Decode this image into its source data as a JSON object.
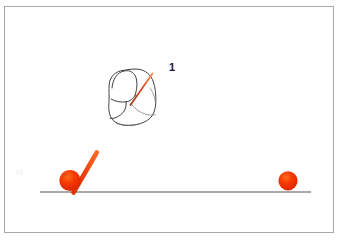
{
  "scene": {
    "title": "Hand-drawn physics sketch: fist with rod and two balls on a ground line",
    "background_color": "#ffffff",
    "border_color": "#a8a8a8",
    "border_width_px": 1,
    "frame": {
      "x": 4,
      "y": 6,
      "width": 330,
      "height": 227
    }
  },
  "labels": {
    "figure_number": "1"
  },
  "colors": {
    "ball_red": "#f03000",
    "ball_red_highlight": "#ff5a0f",
    "ball_red_shadow": "#d02000",
    "rod_red": "#ef3b10",
    "rod_red_dark": "#c23207",
    "sketch_outline": "#2b2b2b",
    "sketch_outline_light": "#8a8a8a",
    "ground_line": "#8d8d8d",
    "faint_mark": "#e2e2e2"
  },
  "elements": {
    "ground_line": {
      "name": "ground-line",
      "x1": 40,
      "y1": 192,
      "x2": 311,
      "y2": 192,
      "stroke_width": 1.6
    },
    "left_ball": {
      "name": "left-ball",
      "cx": 70,
      "cy": 180,
      "r": 10.5
    },
    "right_ball": {
      "name": "right-ball",
      "cx": 288,
      "cy": 180,
      "r": 9.5
    },
    "rod": {
      "name": "red-rod",
      "x1": 73,
      "y1": 192,
      "x2": 97,
      "y2": 152,
      "stroke_width": 4.5
    },
    "fist_sketch": {
      "name": "fist-outline-sketch",
      "bbox": {
        "x": 108,
        "y": 68,
        "width": 50,
        "height": 58
      },
      "inner_stroke": {
        "name": "red-diagonal-stroke",
        "x1": 131,
        "y1": 104,
        "x2": 152,
        "y2": 74,
        "stroke_width": 1.6
      }
    },
    "faint_mark": {
      "name": "faint-smudge-mark",
      "x": 17,
      "y": 170,
      "width": 5,
      "height": 4
    }
  }
}
